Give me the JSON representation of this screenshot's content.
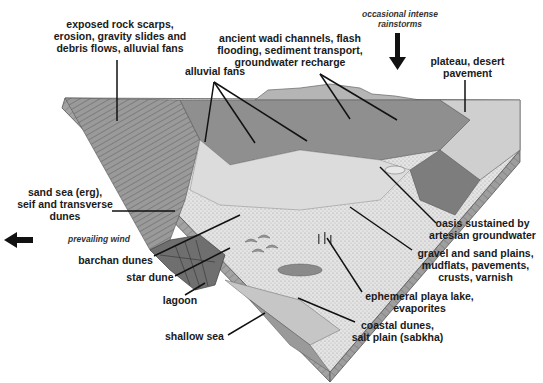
{
  "diagram": {
    "labels": {
      "rock_scarps": [
        "exposed rock scarps,",
        "erosion, gravity slides and",
        "debris flows, alluvial fans"
      ],
      "wadi": [
        "ancient wadi channels, flash",
        "flooding, sediment transport,",
        "groundwater recharge"
      ],
      "rainstorms": [
        "occasional intense",
        "rainstorms"
      ],
      "plateau": [
        "plateau, desert",
        "pavement"
      ],
      "alluvial_fans": [
        "alluvial fans"
      ],
      "sand_sea": [
        "sand sea (erg),",
        "seif and transverse",
        "dunes"
      ],
      "prevailing_wind": [
        "prevailing wind"
      ],
      "barchan": [
        "barchan dunes"
      ],
      "star_dune": [
        "star dune"
      ],
      "lagoon": [
        "lagoon"
      ],
      "shallow_sea": [
        "shallow sea"
      ],
      "oasis": [
        "oasis sustained by",
        "artesian groundwater"
      ],
      "gravel": [
        "gravel and sand plains,",
        "mudflats, pavements,",
        "crusts, varnish"
      ],
      "playa": [
        "ephemeral playa lake,",
        "evaporites"
      ],
      "coastal": [
        "coastal dunes,",
        "salt plain (sabkha)"
      ]
    },
    "colors": {
      "text": "#1a1a1a",
      "leader": "#111111",
      "surface_light": "#d9d9d9",
      "surface_mid": "#a8a8a8",
      "surface_dark": "#6e6e6e",
      "side": "#8c8c8c"
    }
  }
}
